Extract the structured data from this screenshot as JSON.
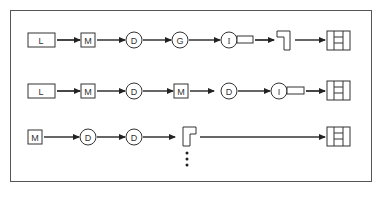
{
  "diagram": {
    "type": "process-flow",
    "rows": [
      {
        "id": "row-1",
        "nodes": [
          {
            "shape": "rect-wide",
            "label": "L"
          },
          {
            "shape": "square",
            "label": "M"
          },
          {
            "shape": "circle",
            "label": "D"
          },
          {
            "shape": "circle",
            "label": "G"
          },
          {
            "shape": "circle-with-tab",
            "label": "I"
          },
          {
            "shape": "gamma-block",
            "label": ""
          },
          {
            "shape": "grid-box",
            "label": ""
          }
        ]
      },
      {
        "id": "row-2",
        "nodes": [
          {
            "shape": "rect-wide",
            "label": "L"
          },
          {
            "shape": "square",
            "label": "M"
          },
          {
            "shape": "circle",
            "label": "D"
          },
          {
            "shape": "square",
            "label": "M"
          },
          {
            "shape": "circle",
            "label": "D"
          },
          {
            "shape": "circle-with-tab",
            "label": "I"
          },
          {
            "shape": "grid-box",
            "label": ""
          }
        ]
      },
      {
        "id": "row-3",
        "nodes": [
          {
            "shape": "square",
            "label": "M"
          },
          {
            "shape": "circle",
            "label": "D"
          },
          {
            "shape": "circle",
            "label": "D"
          },
          {
            "shape": "p-block",
            "label": ""
          },
          {
            "shape": "grid-box",
            "label": ""
          }
        ]
      }
    ],
    "continuation": "vertical-ellipsis",
    "colors": {
      "stroke": "#333333",
      "frame": "#555555",
      "background": "#ffffff"
    }
  },
  "labels": {
    "r1_l": "L",
    "r1_m": "M",
    "r1_d": "D",
    "r1_g": "G",
    "r1_i": "I",
    "r2_l": "L",
    "r2_m1": "M",
    "r2_d1": "D",
    "r2_m2": "M",
    "r2_d2": "D",
    "r2_i": "I",
    "r3_m": "M",
    "r3_d1": "D",
    "r3_d2": "D"
  }
}
